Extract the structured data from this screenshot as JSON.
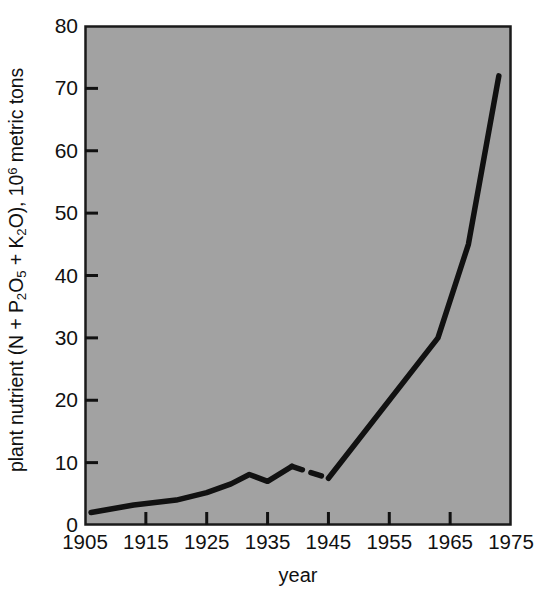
{
  "chart_data": {
    "type": "line",
    "title": "",
    "xlabel": "year",
    "ylabel": "plant nutrient (N + P2O5 + K2O), 10^6 metric tons",
    "ylabel_parts": {
      "lead": "plant nutrient (N + P",
      "sub1": "2",
      "mid1": "O",
      "sub2": "5",
      "mid2": " + K",
      "sub3": "2",
      "mid3": "O), 10",
      "sup1": "6",
      "tail": " metric tons"
    },
    "xlim": [
      1905,
      1975
    ],
    "ylim": [
      0,
      80
    ],
    "xticks": [
      1905,
      1915,
      1925,
      1935,
      1945,
      1955,
      1965,
      1975
    ],
    "yticks": [
      0,
      10,
      20,
      30,
      40,
      50,
      60,
      70,
      80
    ],
    "grid": false,
    "legend": null,
    "plot_background_color": "#a2a2a2",
    "line_color": "#111111",
    "series": [
      {
        "name": "world fertilizer consumption",
        "style": "solid",
        "x": [
          1906,
          1913,
          1920,
          1925,
          1929,
          1932,
          1935,
          1939
        ],
        "values": [
          2.0,
          3.2,
          4.0,
          5.2,
          6.6,
          8.1,
          7.0,
          9.4
        ]
      },
      {
        "name": "world fertilizer consumption (interpolated war years)",
        "style": "dashed",
        "x": [
          1939,
          1945
        ],
        "values": [
          9.4,
          7.5
        ]
      },
      {
        "name": "world fertilizer consumption (postwar)",
        "style": "solid",
        "x": [
          1945,
          1963,
          1968,
          1973
        ],
        "values": [
          7.5,
          30.0,
          45.0,
          72.0
        ]
      }
    ],
    "combined_points": [
      {
        "year": 1906,
        "value": 2.0
      },
      {
        "year": 1913,
        "value": 3.2
      },
      {
        "year": 1920,
        "value": 4.0
      },
      {
        "year": 1925,
        "value": 5.2
      },
      {
        "year": 1929,
        "value": 6.6
      },
      {
        "year": 1932,
        "value": 8.1
      },
      {
        "year": 1935,
        "value": 7.0
      },
      {
        "year": 1939,
        "value": 9.4
      },
      {
        "year": 1945,
        "value": 7.5
      },
      {
        "year": 1963,
        "value": 30.0
      },
      {
        "year": 1968,
        "value": 45.0
      },
      {
        "year": 1973,
        "value": 72.0
      },
      {
        "year": 1974,
        "value": 78.0
      }
    ]
  }
}
